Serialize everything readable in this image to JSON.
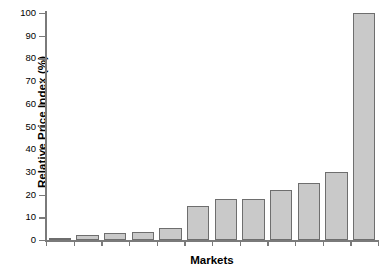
{
  "chart_data": {
    "type": "bar",
    "title": "",
    "xlabel": "Markets",
    "ylabel": "Relative Price Index (%)",
    "categories": [
      "1",
      "2",
      "3",
      "4",
      "5",
      "6",
      "7",
      "8",
      "9",
      "10",
      "11",
      "12"
    ],
    "values": [
      1,
      2,
      3,
      3.5,
      5.5,
      15,
      18,
      18,
      22,
      25,
      30,
      100
    ],
    "ylim": [
      0,
      100
    ],
    "ytick_labels": [
      "0",
      "10",
      "20",
      "30",
      "40",
      "50",
      "60",
      "70",
      "80",
      "90",
      "100"
    ],
    "ytick_values": [
      0,
      10,
      20,
      30,
      40,
      50,
      60,
      70,
      80,
      90,
      100
    ],
    "xtick_labels": [
      "",
      "",
      "",
      "",
      "",
      "",
      "",
      "",
      "",
      "",
      "",
      ""
    ],
    "grid": false,
    "legend": false,
    "bar_fill_color": "#c9c9c9",
    "bar_edge_color": "#6e6e6e",
    "axis_color": "#7a7a7a",
    "background_color": "#ffffff"
  }
}
